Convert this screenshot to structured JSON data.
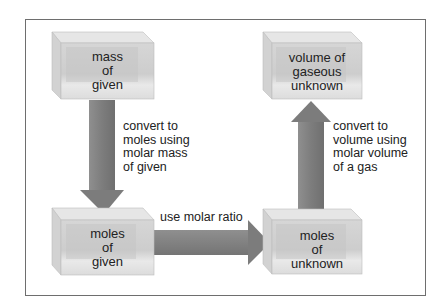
{
  "diagram": {
    "type": "flowchart",
    "colors": {
      "frame_border": "#6e6e6e",
      "box_front": "#c9c9c9",
      "box_top": "#e6e6e6",
      "box_side": "#d5d5d5",
      "arrow_fill": "#8a8a8a",
      "text": "#222222"
    },
    "boxes": [
      {
        "id": "mass_given",
        "lines": [
          "mass",
          "of",
          "given"
        ]
      },
      {
        "id": "moles_given",
        "lines": [
          "moles",
          "of",
          "given"
        ]
      },
      {
        "id": "moles_unknown",
        "lines": [
          "moles",
          "of",
          "unknown"
        ]
      },
      {
        "id": "volume_unknown",
        "lines": [
          "volume of",
          "gaseous",
          "unknown"
        ]
      }
    ],
    "arrows": [
      {
        "from": "mass_given",
        "to": "moles_given",
        "direction": "down",
        "label_lines": [
          "convert to",
          "moles using",
          "molar mass",
          "of given"
        ]
      },
      {
        "from": "moles_given",
        "to": "moles_unknown",
        "direction": "right",
        "label_lines": [
          "use molar ratio"
        ]
      },
      {
        "from": "moles_unknown",
        "to": "volume_unknown",
        "direction": "up",
        "label_lines": [
          "convert to",
          "volume using",
          "molar volume",
          "of a gas"
        ]
      }
    ]
  }
}
